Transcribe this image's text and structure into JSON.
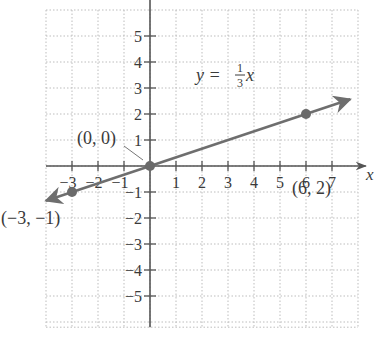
{
  "chart_data": {
    "type": "line",
    "title": "",
    "equation": {
      "lhs": "y =",
      "num": "1",
      "den": "3",
      "var": "x"
    },
    "xlabel": "x",
    "ylabel": "",
    "xlim": [
      -4,
      8
    ],
    "ylim": [
      -6,
      6
    ],
    "x_ticks": [
      -3,
      -2,
      -1,
      1,
      2,
      3,
      4,
      5,
      6,
      7
    ],
    "x_tick_labels": [
      "−3",
      "−2",
      "−1",
      "1",
      "2",
      "3",
      "4",
      "5",
      "6",
      "7"
    ],
    "y_ticks": [
      5,
      4,
      3,
      2,
      1,
      -1,
      -2,
      -3,
      -4,
      -5
    ],
    "y_tick_labels": [
      "5",
      "4",
      "3",
      "2",
      "1",
      "−1",
      "−2",
      "−3",
      "−4",
      "−5"
    ],
    "grid": true,
    "series": [
      {
        "name": "y = (1/3)x",
        "slope": 0.3333,
        "intercept": 0,
        "x": [
          -4,
          7.7
        ],
        "y": [
          -1.333,
          2.567
        ]
      }
    ],
    "points": [
      {
        "x": 0,
        "y": 0,
        "label": "(0, 0)"
      },
      {
        "x": 6,
        "y": 2,
        "label": "(6, 2)"
      },
      {
        "x": -3,
        "y": -1,
        "label": "(−3, −1)"
      }
    ]
  },
  "colors": {
    "axis": "#555555",
    "grid": "#bdbdbd",
    "line": "#6e6e6e",
    "point": "#6a6a6a",
    "text": "#3a3a3a"
  }
}
